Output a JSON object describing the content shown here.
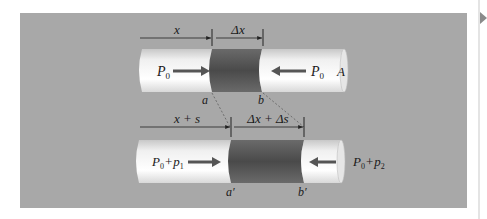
{
  "figure": {
    "colors": {
      "panel": "#a8a8a8",
      "cylinder_light": "#f4f4f4",
      "element_dark": "#555555",
      "arrow": "#555555",
      "text": "#1a1a1a"
    }
  },
  "top_tube": {
    "dim_x": "x",
    "dim_dx": "Δx",
    "left_pressure": "P",
    "left_pressure_sub": "0",
    "right_pressure": "P",
    "right_pressure_sub": "0",
    "area_label": "A",
    "point_a": "a",
    "point_b": "b"
  },
  "bottom_tube": {
    "dim_x": "x + s",
    "dim_dx": "Δx + Δs",
    "left_pressure": "P",
    "left_pressure_sub0": "0",
    "left_plus": "+",
    "left_p": "p",
    "left_p_sub": "1",
    "right_pressure": "P",
    "right_pressure_sub0": "0",
    "right_plus": "+",
    "right_p": "p",
    "right_p_sub": "2",
    "point_a": "a′",
    "point_b": "b′"
  }
}
